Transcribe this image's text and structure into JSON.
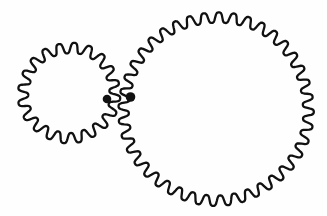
{
  "figure": {
    "background_color": "#fefefe",
    "ink_color": "#111111",
    "canvas": {
      "width": 327,
      "height": 216
    },
    "gears": [
      {
        "name": "small-gear",
        "cx": 69,
        "cy": 93,
        "mid_radius": 45.5,
        "tooth_amplitude": 5.2,
        "teeth": 20,
        "phase_deg": -34.2,
        "stroke_width": 2.3
      },
      {
        "name": "large-gear",
        "cx": 216,
        "cy": 109,
        "mid_radius": 92,
        "tooth_amplitude": 5.2,
        "teeth": 40,
        "phase_deg": 21.6,
        "stroke_width": 2.3
      }
    ],
    "marker_dots": [
      {
        "name": "small-gear-mark-dot",
        "cx": 107,
        "cy": 99,
        "r": 4.3
      },
      {
        "name": "large-gear-mark-dot",
        "cx": 130.5,
        "cy": 97,
        "r": 4.8
      }
    ]
  }
}
